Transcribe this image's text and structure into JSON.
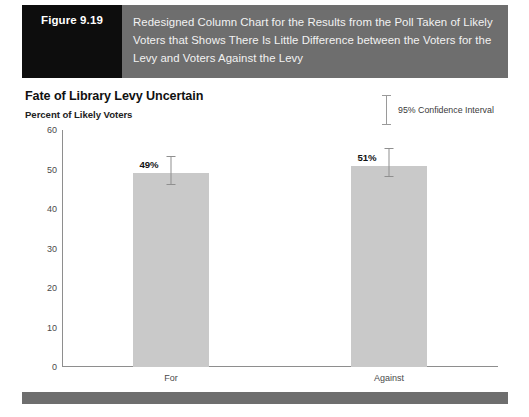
{
  "figure": {
    "number_label": "Figure 9.19",
    "caption": "Redesigned Column Chart for the Results from the Poll Taken of Likely Voters that Shows There Is Little Difference between the Voters for the Levy and Voters Against the Levy",
    "number_block_color": "#0d0d0d",
    "caption_block_color": "#6e6e6e",
    "footer_bar_color": "#6e6e6e"
  },
  "chart": {
    "title": "Fate of Library Levy Uncertain",
    "subtitle": "Percent of Likely Voters",
    "legend": {
      "label": "95% Confidence Interval",
      "icon": "error-bar-icon"
    }
  },
  "chart_data": {
    "type": "bar",
    "title": "Fate of Library Levy Uncertain",
    "subtitle": "Percent of Likely Voters",
    "xlabel": "",
    "ylabel": "Percent of Likely Voters",
    "categories": [
      "For",
      "Against"
    ],
    "values": [
      49,
      51
    ],
    "value_labels": [
      "49%",
      "51%"
    ],
    "error_bars": [
      {
        "category": "For",
        "low": 46,
        "high": 53.5
      },
      {
        "category": "Against",
        "low": 48,
        "high": 55.5
      }
    ],
    "ylim": [
      0,
      60
    ],
    "yticks": [
      0,
      10,
      20,
      30,
      40,
      50,
      60
    ],
    "ytick_labels": [
      "0",
      "10",
      "20",
      "30",
      "40",
      "50",
      "60"
    ],
    "grid": false,
    "legend_position": "top-right",
    "legend_entries": [
      "95% Confidence Interval"
    ],
    "bar_color": "#c9c9c9",
    "axis_color": "#8e8e8e"
  }
}
